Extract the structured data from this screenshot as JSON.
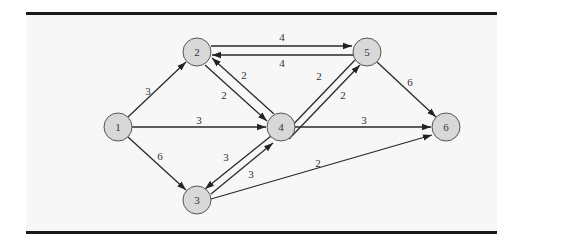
{
  "figure": {
    "type": "directed-network",
    "nodes": [
      {
        "id": "1",
        "label": "1",
        "x": 118,
        "y": 127
      },
      {
        "id": "2",
        "label": "2",
        "x": 197,
        "y": 52
      },
      {
        "id": "3",
        "label": "3",
        "x": 197,
        "y": 200
      },
      {
        "id": "4",
        "label": "4",
        "x": 281,
        "y": 127
      },
      {
        "id": "5",
        "label": "5",
        "x": 367,
        "y": 52
      },
      {
        "id": "6",
        "label": "6",
        "x": 446,
        "y": 127
      }
    ],
    "edges": [
      {
        "from": "1",
        "to": "2",
        "weight": "3"
      },
      {
        "from": "1",
        "to": "4",
        "weight": "3"
      },
      {
        "from": "1",
        "to": "3",
        "weight": "6"
      },
      {
        "from": "2",
        "to": "5",
        "weight": "4"
      },
      {
        "from": "5",
        "to": "2",
        "weight": "4"
      },
      {
        "from": "2",
        "to": "4",
        "weight": "2"
      },
      {
        "from": "4",
        "to": "2",
        "weight": "2"
      },
      {
        "from": "4",
        "to": "5",
        "weight": "2"
      },
      {
        "from": "5",
        "to": "4",
        "weight": "2"
      },
      {
        "from": "3",
        "to": "4",
        "weight": "3"
      },
      {
        "from": "4",
        "to": "3",
        "weight": "3"
      },
      {
        "from": "4",
        "to": "6",
        "weight": "3"
      },
      {
        "from": "5",
        "to": "6",
        "weight": "6"
      },
      {
        "from": "3",
        "to": "6",
        "weight": "2"
      }
    ]
  },
  "labels": {
    "n1": "1",
    "n2": "2",
    "n3": "3",
    "n4": "4",
    "n5": "5",
    "n6": "6",
    "e12": "3",
    "e14": "3",
    "e13": "6",
    "e25": "4",
    "e52": "4",
    "e24": "2",
    "e42": "2",
    "e45": "2",
    "e54": "2",
    "e34": "3",
    "e43": "3",
    "e46": "3",
    "e56": "6",
    "e36": "2"
  }
}
